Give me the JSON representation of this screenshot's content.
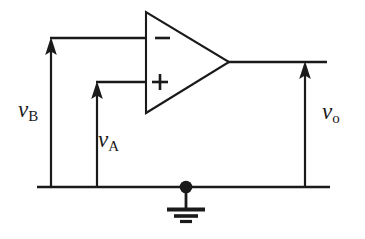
{
  "figure": {
    "type": "circuit-schematic",
    "background_color": "#ffffff",
    "line_color": "#1a1a1a"
  },
  "opamp": {
    "name": "operational-amplifier",
    "shape": "triangle",
    "inverting_input_label": "−",
    "noninverting_input_label": "+",
    "vertices": {
      "top_left_x": 146,
      "top_left_y": 12,
      "bottom_left_x": 146,
      "bottom_left_y": 113,
      "apex_x": 229,
      "apex_y": 62
    }
  },
  "signals": [
    {
      "id": "vb",
      "var": "v",
      "subscript": "B",
      "role": "inverting-input-voltage",
      "arrow_direction": "up",
      "arrow_x": 51,
      "arrow_top_y": 44,
      "arrow_bottom_y": 186,
      "wire_y": 38,
      "wire_from_x": 50,
      "wire_to_x": 146
    },
    {
      "id": "va",
      "var": "v",
      "subscript": "A",
      "role": "noninverting-input-voltage",
      "arrow_direction": "up",
      "arrow_x": 97,
      "arrow_top_y": 88,
      "arrow_bottom_y": 186,
      "wire_y": 82,
      "wire_from_x": 96,
      "wire_to_x": 146
    },
    {
      "id": "vo",
      "var": "v",
      "subscript": "o",
      "role": "output-voltage",
      "arrow_direction": "up",
      "arrow_x": 305,
      "arrow_top_y": 68,
      "arrow_bottom_y": 186,
      "wire_y": 62,
      "wire_from_x": 229,
      "wire_to_x": 327
    }
  ],
  "ground_rail": {
    "name": "ground-rail",
    "y": 187,
    "from_x": 37,
    "to_x": 330
  },
  "ground_symbol": {
    "name": "earth-ground",
    "node_x": 186,
    "node_y": 187,
    "node_radius": 6,
    "stem_bottom_y": 208,
    "bar_widths": [
      38,
      24,
      12
    ],
    "bar_ys": [
      209,
      216,
      222
    ]
  }
}
